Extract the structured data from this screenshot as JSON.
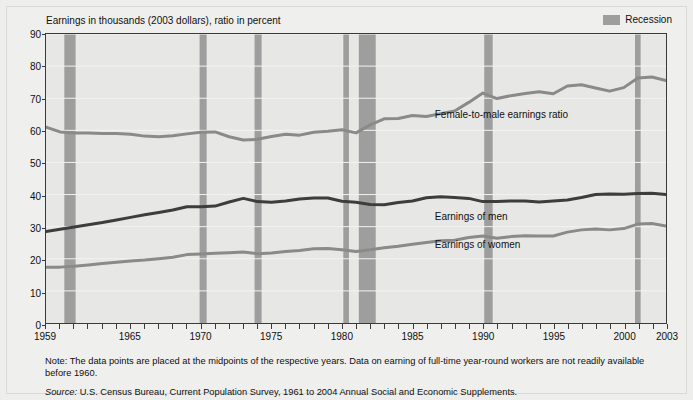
{
  "chart_title": "Earnings in thousands (2003 dollars), ratio in percent",
  "y_axis_title": "Median Annual Earnings, 1998 Dollars (thousands)",
  "legend": {
    "recession_label": "Recession",
    "recession_color": "#9e9e9e"
  },
  "series_labels": {
    "ratio": "Female-to-male earnings ratio",
    "men": "Earnings of men",
    "women": "Earnings of women"
  },
  "notes": {
    "note": "Note: The data points are placed at the midpoints of the respective years. Data on earning of full-time year-round workers are not readily available before 1960.",
    "source_word": "Source:",
    "source_text": " U.S. Census Bureau, Current Population Survey, 1961 to 2004 Annual Social and Economic Supplements."
  },
  "chart_data": {
    "type": "line",
    "title": "Earnings in thousands (2003 dollars), ratio in percent",
    "xlabel": "",
    "ylabel": "Median Annual Earnings, 1998 Dollars (thousands)",
    "xlim": [
      1959,
      2003
    ],
    "ylim": [
      0,
      90
    ],
    "y_ticks": [
      0,
      10,
      20,
      30,
      40,
      50,
      60,
      70,
      80,
      90
    ],
    "x_ticks_labeled": [
      1959,
      1965,
      1970,
      1975,
      1980,
      1985,
      1990,
      1995,
      2000,
      2003
    ],
    "x_tick_interval": 1,
    "grid": "horizontal",
    "legend_position": "top-right",
    "x": [
      1959,
      1960,
      1961,
      1962,
      1963,
      1964,
      1965,
      1966,
      1967,
      1968,
      1969,
      1970,
      1971,
      1972,
      1973,
      1974,
      1975,
      1976,
      1977,
      1978,
      1979,
      1980,
      1981,
      1982,
      1983,
      1984,
      1985,
      1986,
      1987,
      1988,
      1989,
      1990,
      1991,
      1992,
      1993,
      1994,
      1995,
      1996,
      1997,
      1998,
      1999,
      2000,
      2001,
      2002,
      2003
    ],
    "series": [
      {
        "name": "Female-to-male earnings ratio",
        "color": "#8a8a8a",
        "unit": "percent",
        "values": [
          61.0,
          59.5,
          59.2,
          59.2,
          59.0,
          59.0,
          58.8,
          58.2,
          58.0,
          58.3,
          58.9,
          59.4,
          59.5,
          58.0,
          57.0,
          57.2,
          58.1,
          58.8,
          58.5,
          59.4,
          59.7,
          60.2,
          59.2,
          61.7,
          63.6,
          63.7,
          64.6,
          64.3,
          65.2,
          66.0,
          68.7,
          71.6,
          69.9,
          70.8,
          71.5,
          72.0,
          71.4,
          73.8,
          74.2,
          73.2,
          72.2,
          73.3,
          76.3,
          76.6,
          75.5
        ]
      },
      {
        "name": "Earnings of men",
        "color": "#3d3d3d",
        "unit": "thousands of 2003 dollars",
        "values": [
          28.5,
          29.2,
          29.9,
          30.6,
          31.3,
          32.1,
          32.9,
          33.7,
          34.4,
          35.2,
          36.2,
          36.2,
          36.4,
          37.7,
          38.8,
          37.8,
          37.6,
          38.0,
          38.6,
          38.9,
          38.9,
          37.9,
          37.6,
          36.9,
          36.8,
          37.5,
          38.0,
          39.0,
          39.3,
          39.1,
          38.8,
          37.8,
          37.8,
          38.0,
          38.0,
          37.7,
          38.0,
          38.3,
          39.1,
          40.0,
          40.2,
          40.1,
          40.3,
          40.4,
          40.0
        ]
      },
      {
        "name": "Earnings of women",
        "color": "#8a8a8a",
        "unit": "thousands of 2003 dollars",
        "values": [
          17.4,
          17.4,
          17.7,
          18.1,
          18.5,
          18.9,
          19.3,
          19.6,
          20.0,
          20.5,
          21.3,
          21.5,
          21.7,
          21.9,
          22.1,
          21.6,
          21.8,
          22.3,
          22.6,
          23.1,
          23.2,
          22.8,
          22.3,
          22.8,
          23.4,
          23.9,
          24.5,
          25.1,
          25.6,
          25.8,
          26.6,
          27.1,
          26.4,
          26.9,
          27.2,
          27.1,
          27.1,
          28.3,
          29.0,
          29.3,
          29.0,
          29.4,
          30.8,
          31.0,
          30.2
        ]
      }
    ],
    "recessions": [
      {
        "label": "1960-1961",
        "start": 1960.3,
        "end": 1961.1
      },
      {
        "label": "1969-1970",
        "start": 1969.9,
        "end": 1970.4
      },
      {
        "label": "1973-1975",
        "start": 1973.8,
        "end": 1974.3
      },
      {
        "label": "1980",
        "start": 1980.1,
        "end": 1980.5
      },
      {
        "label": "1981-1982",
        "start": 1981.2,
        "end": 1982.4
      },
      {
        "label": "1990-1991",
        "start": 1990.1,
        "end": 1990.7
      },
      {
        "label": "2001",
        "start": 2000.8,
        "end": 2001.2
      }
    ]
  }
}
